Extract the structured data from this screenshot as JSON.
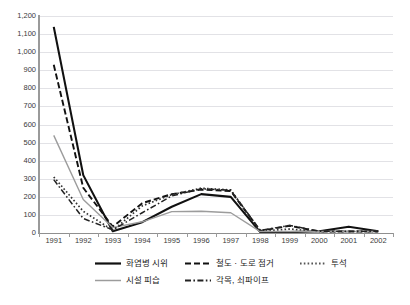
{
  "chart_title": "",
  "chart_data": {
    "type": "line",
    "title": "",
    "xlabel": "",
    "ylabel": "",
    "ylim": [
      0,
      1200
    ],
    "ytick_step": 100,
    "grid": true,
    "legend_position": "bottom",
    "categories": [
      "1991",
      "1992",
      "1993",
      "1994",
      "1995",
      "1996",
      "1997",
      "1998",
      "1999",
      "2000",
      "2001",
      "2002"
    ],
    "yticks": [
      "0",
      "100",
      "200",
      "300",
      "400",
      "500",
      "600",
      "700",
      "800",
      "900",
      "1,000",
      "1,100",
      "1,200"
    ],
    "series": [
      {
        "name": "화염병 시위",
        "style": "solid",
        "color": "#111111",
        "width": 2.1,
        "values": [
          1140,
          320,
          10,
          60,
          145,
          215,
          200,
          5,
          5,
          10,
          35,
          10
        ]
      },
      {
        "name": "철도 · 도로 점거",
        "style": "dashed",
        "color": "#111111",
        "width": 1.9,
        "values": [
          930,
          250,
          35,
          165,
          215,
          240,
          232,
          12,
          40,
          8,
          8,
          8
        ]
      },
      {
        "name": "투석",
        "style": "dotted",
        "color": "#333333",
        "width": 1.7,
        "values": [
          310,
          120,
          15,
          150,
          212,
          248,
          238,
          10,
          22,
          8,
          8,
          8
        ]
      },
      {
        "name": "시설 피습",
        "style": "solid",
        "color": "#9c9c9c",
        "width": 1.4,
        "values": [
          540,
          185,
          30,
          62,
          118,
          120,
          112,
          8,
          8,
          8,
          8,
          8
        ]
      },
      {
        "name": "각목, 쇠파이프",
        "style": "dashdot",
        "color": "#222222",
        "width": 1.5,
        "values": [
          295,
          80,
          18,
          112,
          205,
          245,
          236,
          15,
          42,
          10,
          10,
          10
        ]
      }
    ]
  },
  "legend": {
    "items": [
      {
        "label": "화염병 시위",
        "style": "solid",
        "color": "#111111"
      },
      {
        "label": "철도 · 도로 점거",
        "style": "dashed",
        "color": "#111111"
      },
      {
        "label": "투석",
        "style": "dotted",
        "color": "#555555"
      },
      {
        "label": "시설 피습",
        "style": "solid",
        "color": "#9c9c9c"
      },
      {
        "label": "각목, 쇠파이프",
        "style": "dashdot",
        "color": "#222222"
      }
    ]
  }
}
